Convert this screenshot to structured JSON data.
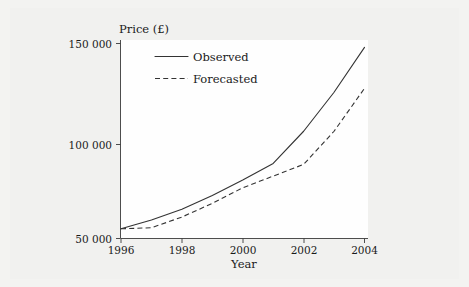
{
  "chart_data": {
    "type": "line",
    "title": "",
    "xlabel": "Year",
    "ylabel": "Price (£)",
    "xlim": [
      1996,
      2004
    ],
    "ylim": [
      50000,
      150000
    ],
    "grid": false,
    "legend_position": "top-left-inside",
    "x_tick_labels": [
      "1996",
      "1998",
      "2000",
      "2002",
      "2004"
    ],
    "x_ticks": [
      1996,
      1998,
      2000,
      2002,
      2004
    ],
    "y_tick_labels": [
      "50 000",
      "100 000",
      "150 000"
    ],
    "y_ticks": [
      50000,
      100000,
      150000
    ],
    "x": [
      1996,
      1997,
      1998,
      1999,
      2000,
      2001,
      2002,
      2003,
      2004
    ],
    "series": [
      {
        "name": "Observed",
        "style": "solid",
        "values": [
          55000,
          59500,
          65000,
          72000,
          80000,
          88500,
          105000,
          125000,
          148000
        ]
      },
      {
        "name": "Forecasted",
        "style": "dashed",
        "values": [
          55000,
          55500,
          61000,
          68000,
          76000,
          82000,
          88000,
          105000,
          127000
        ]
      }
    ]
  },
  "legend": {
    "entries": [
      {
        "label": "Observed",
        "style": "solid"
      },
      {
        "label": "Forecasted",
        "style": "dashed"
      }
    ]
  },
  "axes": {
    "y_title": "Price (£)",
    "x_title": "Year"
  },
  "ticks": {
    "y": [
      {
        "label": "150 000",
        "value": 150000
      },
      {
        "label": "100 000",
        "value": 100000
      },
      {
        "label": "50 000",
        "value": 50000
      }
    ],
    "x": [
      {
        "label": "1996",
        "value": 1996
      },
      {
        "label": "1998",
        "value": 1998
      },
      {
        "label": "2000",
        "value": 2000
      },
      {
        "label": "2002",
        "value": 2002
      },
      {
        "label": "2004",
        "value": 2004
      }
    ]
  },
  "colors": {
    "line": "#333333",
    "axis": "#3a3a3a",
    "page_background": "#f2f2f0",
    "plot_background": "#fefefe"
  }
}
